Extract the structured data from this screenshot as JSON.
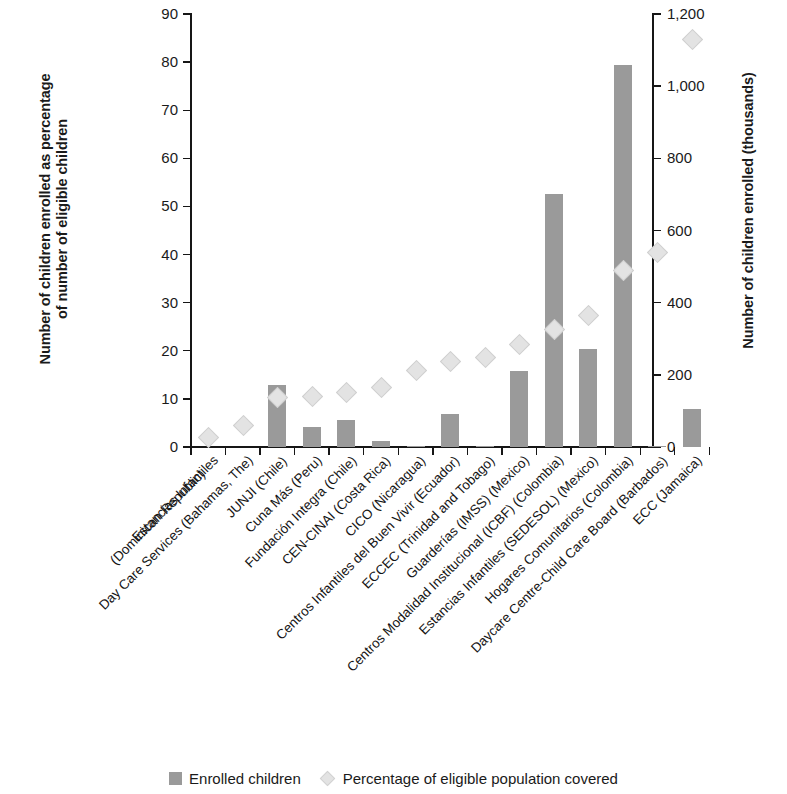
{
  "chart_data": {
    "type": "bar",
    "title": "",
    "subtitle": "",
    "xlabel": "",
    "ylabel": "Number of children enrolled as percentage\nof number of eligible children",
    "y2label": "Number of children enrolled (thousands)",
    "grid": false,
    "legend_position": "bottom",
    "ylim": [
      0,
      90
    ],
    "y2lim": [
      0,
      1200
    ],
    "yticks": [
      0,
      10,
      20,
      30,
      40,
      50,
      60,
      70,
      80,
      90
    ],
    "ytick_labels": [
      "0",
      "10",
      "20",
      "30",
      "40",
      "50",
      "60",
      "70",
      "80",
      "90"
    ],
    "y2ticks": [
      0,
      200,
      400,
      600,
      800,
      1000,
      1200
    ],
    "y2tick_labels": [
      "0",
      "200",
      "400",
      "600",
      "800",
      "1,000",
      "1,200"
    ],
    "categories": [
      "Estancias Infantiles\n(Dominican Republic)",
      "Day Care Services (Bahamas, The)",
      "JUNJI (Chile)",
      "Cuna Más (Peru)",
      "Fundación Integra (Chile)",
      "CEN-CINAI (Costa Rica)",
      "CICO (Nicaragua)",
      "Centros Infantiles del Buen Vivir (Ecuador)",
      "ECCEC (Trinidad and Tobago)",
      "Guarderías (IMSS) (Mexico)",
      "Centros Modalidad Institucional (ICBF) (Colombia)",
      "Estancias Infantiles (SEDESOL) (Mexico)",
      "Hogares Comunitarios (Colombia)",
      "Daycare Centre-Child Care Board (Barbados)",
      "ECC (Jamaica)"
    ],
    "series": [
      {
        "name": "Enrolled children",
        "axis": "right",
        "unit": "thousands",
        "color": "#9a9a9a",
        "marker": "bar",
        "values": [
          0,
          0,
          170,
          55,
          75,
          17,
          2,
          92,
          3,
          210,
          700,
          270,
          1060,
          3,
          105
        ]
      },
      {
        "name": "Percentage of eligible population covered",
        "axis": "left",
        "unit": "percent",
        "color": "#e3e3e3",
        "marker": "diamond",
        "values": [
          2,
          4.6,
          10.4,
          10.6,
          11.5,
          12.4,
          16.1,
          17.9,
          18.8,
          21.4,
          24.6,
          27.4,
          36.8,
          40.6,
          84.7
        ]
      }
    ],
    "bar_values_left_axis_equivalent": [
      0,
      0,
      12.8,
      4.1,
      5.6,
      1.3,
      0.15,
      6.9,
      0.2,
      15.8,
      52.5,
      20.3,
      79.5,
      0.2,
      7.9
    ],
    "legend": [
      {
        "label": "Enrolled children",
        "swatch": "square",
        "color": "#9a9a9a"
      },
      {
        "label": "Percentage of eligible population covered",
        "swatch": "diamond",
        "color": "#e3e3e3"
      }
    ]
  }
}
